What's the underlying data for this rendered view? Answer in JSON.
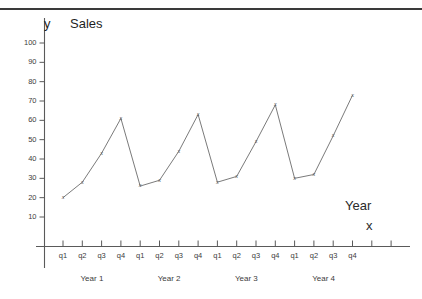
{
  "title": "Sales",
  "y_axis_symbol": "y",
  "x_axis_symbol": "x",
  "x_axis_name": "Year",
  "colors": {
    "rule": "#3a3a3a",
    "axis": "#5a5a5a",
    "series": "#6b6b6b",
    "text": "#2b2b2b"
  },
  "chart_data": {
    "type": "line",
    "title": "Sales",
    "xlabel": "Year",
    "ylabel": "y",
    "ylim": [
      0,
      105
    ],
    "grid": false,
    "legend": "none",
    "marker": "x",
    "y_ticks": [
      10,
      20,
      30,
      40,
      50,
      60,
      70,
      80,
      90,
      100
    ],
    "categories": [
      "q1",
      "q2",
      "q3",
      "q4",
      "q1",
      "q2",
      "q3",
      "q4",
      "q1",
      "q2",
      "q3",
      "q4",
      "q1",
      "q2",
      "q3",
      "q4"
    ],
    "groups": [
      "Year 1",
      "Year 2",
      "Year 3",
      "Year 4"
    ],
    "values": [
      20,
      28,
      43,
      61,
      26,
      29,
      44,
      63,
      28,
      31,
      49,
      68,
      30,
      32,
      52,
      73
    ],
    "series": [
      {
        "name": "Sales",
        "values": [
          20,
          28,
          43,
          61,
          26,
          29,
          44,
          63,
          28,
          31,
          49,
          68,
          30,
          32,
          52,
          73
        ]
      }
    ],
    "extra_unlabeled_ticks": 2
  }
}
